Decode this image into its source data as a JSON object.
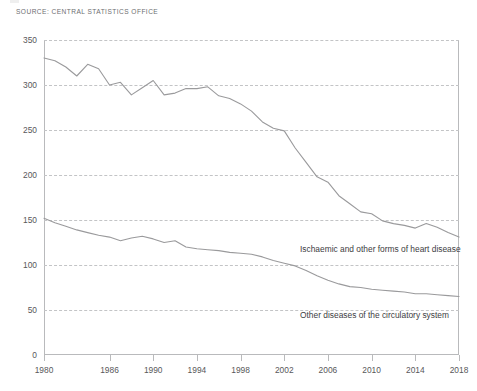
{
  "source": {
    "text": "SOURCE: CENTRAL STATISTICS OFFICE"
  },
  "chart_data": {
    "type": "line",
    "title": "",
    "subtitle": "",
    "xlabel": "",
    "ylabel": "",
    "xlim": [
      1980,
      2018
    ],
    "ylim": [
      0,
      350
    ],
    "grid": true,
    "legend_position": "inline-labels",
    "yticks": [
      0,
      50,
      100,
      150,
      200,
      250,
      300,
      350
    ],
    "ytick_labels": [
      "0",
      "50",
      "100",
      "150",
      "200",
      "250",
      "300",
      "350"
    ],
    "xticks": [
      1980,
      1986,
      1990,
      1994,
      1998,
      2002,
      2006,
      2010,
      2014,
      2018
    ],
    "xtick_labels": [
      "1980",
      "1986",
      "1990",
      "1994",
      "1998",
      "2002",
      "2006",
      "2010",
      "2014",
      "2018"
    ],
    "line_color": "#9a9a9c",
    "grid_color": "#c3c4c6",
    "axis_color": "#b9babc",
    "x": [
      1980,
      1981,
      1982,
      1983,
      1984,
      1985,
      1986,
      1987,
      1988,
      1989,
      1990,
      1991,
      1992,
      1993,
      1994,
      1995,
      1996,
      1997,
      1998,
      1999,
      2000,
      2001,
      2002,
      2003,
      2004,
      2005,
      2006,
      2007,
      2008,
      2009,
      2010,
      2011,
      2012,
      2013,
      2014,
      2015,
      2016,
      2017,
      2018
    ],
    "series": [
      {
        "name": "Ischaemic and other forms of heart disease",
        "label": "Ischaemic and other forms of heart disease",
        "values": [
          330,
          327,
          320,
          310,
          323,
          318,
          300,
          303,
          289,
          297,
          305,
          289,
          291,
          296,
          296,
          298,
          288,
          285,
          279,
          271,
          259,
          252,
          249,
          230,
          214,
          198,
          192,
          177,
          168,
          159,
          157,
          149,
          146,
          144,
          141,
          146,
          142,
          136,
          131
        ]
      },
      {
        "name": "Other diseases of the circulatory system",
        "label": "Other diseases of the circulatory system",
        "values": [
          152,
          147,
          143,
          139,
          136,
          133,
          131,
          127,
          130,
          132,
          129,
          125,
          127,
          120,
          118,
          117,
          116,
          114,
          113,
          112,
          109,
          105,
          102,
          99,
          94,
          88,
          83,
          79,
          76,
          75,
          73,
          72,
          71,
          70,
          68,
          68,
          67,
          66,
          65
        ]
      }
    ]
  }
}
